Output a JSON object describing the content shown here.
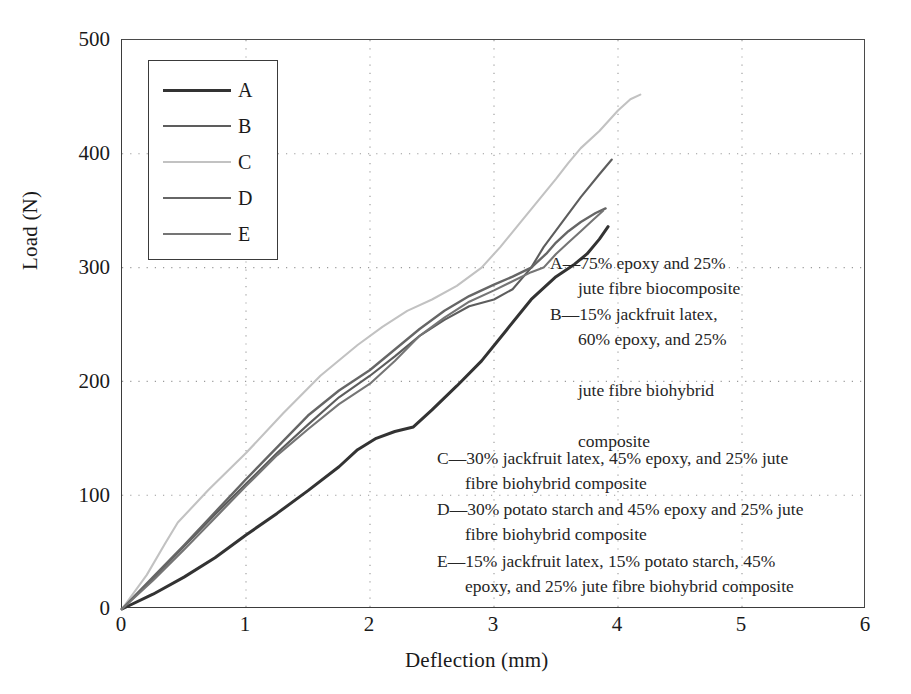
{
  "chart_data": {
    "type": "line",
    "title": "",
    "xlabel": "Deflection (mm)",
    "ylabel": "Load (N)",
    "xlim": [
      0,
      6
    ],
    "ylim": [
      0,
      500
    ],
    "xticks": [
      "0",
      "1",
      "2",
      "3",
      "4",
      "5",
      "6"
    ],
    "yticks": [
      "0",
      "100",
      "200",
      "300",
      "400",
      "500"
    ],
    "grid": "dotted",
    "legend_position": "upper-left-inside",
    "series": [
      {
        "name": "A",
        "color": "#333333",
        "width": 3.0,
        "points": [
          [
            0,
            0
          ],
          [
            0.25,
            13
          ],
          [
            0.5,
            28
          ],
          [
            0.75,
            45
          ],
          [
            1.0,
            65
          ],
          [
            1.25,
            84
          ],
          [
            1.5,
            104
          ],
          [
            1.75,
            125
          ],
          [
            1.9,
            140
          ],
          [
            2.05,
            150
          ],
          [
            2.2,
            156
          ],
          [
            2.35,
            160
          ],
          [
            2.5,
            175
          ],
          [
            2.7,
            196
          ],
          [
            2.9,
            218
          ],
          [
            3.1,
            245
          ],
          [
            3.3,
            272
          ],
          [
            3.5,
            292
          ],
          [
            3.65,
            303
          ],
          [
            3.75,
            312
          ],
          [
            3.85,
            325
          ],
          [
            3.92,
            336
          ]
        ]
      },
      {
        "name": "B",
        "color": "#5d5d5d",
        "width": 2.1,
        "points": [
          [
            0,
            0
          ],
          [
            0.25,
            27
          ],
          [
            0.5,
            55
          ],
          [
            0.75,
            83
          ],
          [
            1.0,
            110
          ],
          [
            1.25,
            137
          ],
          [
            1.5,
            162
          ],
          [
            1.75,
            186
          ],
          [
            2.0,
            205
          ],
          [
            2.2,
            222
          ],
          [
            2.4,
            240
          ],
          [
            2.6,
            254
          ],
          [
            2.8,
            266
          ],
          [
            3.0,
            272
          ],
          [
            3.15,
            281
          ],
          [
            3.3,
            300
          ],
          [
            3.4,
            318
          ],
          [
            3.55,
            340
          ],
          [
            3.7,
            362
          ],
          [
            3.85,
            382
          ],
          [
            3.95,
            395
          ]
        ]
      },
      {
        "name": "C",
        "color": "#c2c2c2",
        "width": 2.1,
        "points": [
          [
            0,
            0
          ],
          [
            0.2,
            30
          ],
          [
            0.35,
            58
          ],
          [
            0.45,
            76
          ],
          [
            0.7,
            105
          ],
          [
            1.0,
            137
          ],
          [
            1.3,
            172
          ],
          [
            1.6,
            205
          ],
          [
            1.9,
            232
          ],
          [
            2.1,
            248
          ],
          [
            2.3,
            262
          ],
          [
            2.5,
            272
          ],
          [
            2.7,
            284
          ],
          [
            2.9,
            300
          ],
          [
            3.05,
            318
          ],
          [
            3.2,
            338
          ],
          [
            3.35,
            358
          ],
          [
            3.5,
            378
          ],
          [
            3.6,
            392
          ],
          [
            3.7,
            405
          ],
          [
            3.85,
            420
          ],
          [
            4.0,
            438
          ],
          [
            4.1,
            448
          ],
          [
            4.18,
            452
          ]
        ]
      },
      {
        "name": "D",
        "color": "#666666",
        "width": 2.4,
        "points": [
          [
            0,
            0
          ],
          [
            0.25,
            28
          ],
          [
            0.5,
            56
          ],
          [
            0.75,
            85
          ],
          [
            1.0,
            114
          ],
          [
            1.25,
            142
          ],
          [
            1.5,
            170
          ],
          [
            1.75,
            192
          ],
          [
            2.0,
            210
          ],
          [
            2.2,
            228
          ],
          [
            2.4,
            246
          ],
          [
            2.6,
            262
          ],
          [
            2.8,
            275
          ],
          [
            3.0,
            285
          ],
          [
            3.15,
            292
          ],
          [
            3.3,
            300
          ],
          [
            3.42,
            312
          ],
          [
            3.5,
            322
          ],
          [
            3.6,
            332
          ],
          [
            3.7,
            340
          ],
          [
            3.82,
            348
          ],
          [
            3.9,
            352
          ]
        ]
      },
      {
        "name": "E",
        "color": "#757575",
        "width": 2.1,
        "points": [
          [
            0,
            0
          ],
          [
            0.25,
            25
          ],
          [
            0.5,
            52
          ],
          [
            0.75,
            80
          ],
          [
            1.0,
            108
          ],
          [
            1.25,
            135
          ],
          [
            1.5,
            158
          ],
          [
            1.75,
            180
          ],
          [
            2.0,
            198
          ],
          [
            2.2,
            218
          ],
          [
            2.4,
            240
          ],
          [
            2.6,
            256
          ],
          [
            2.8,
            270
          ],
          [
            3.0,
            280
          ],
          [
            3.15,
            288
          ],
          [
            3.3,
            296
          ],
          [
            3.4,
            300
          ],
          [
            3.5,
            312
          ],
          [
            3.6,
            322
          ],
          [
            3.7,
            332
          ],
          [
            3.8,
            342
          ],
          [
            3.88,
            350
          ]
        ]
      }
    ],
    "annotations": [
      "A—75% epoxy and 25% jute fibre biocomposite",
      "B—15% jackfruit latex, 60% epoxy, and 25% jute fibre biohybrid composite",
      "C—30% jackfruit latex, 45% epoxy, and 25% jute fibre biohybrid composite",
      "D—30% potato starch and 45% epoxy and 25% jute fibre biohybrid composite",
      "E—15% jackfruit latex, 15% potato starch, 45% epoxy, and 25% jute fibre biohybrid composite"
    ]
  },
  "legend": {
    "items": [
      {
        "label": "A"
      },
      {
        "label": "B"
      },
      {
        "label": "C"
      },
      {
        "label": "D"
      },
      {
        "label": "E"
      }
    ]
  },
  "descriptions": [
    {
      "id": "A",
      "line1": "A—75% epoxy and 25%",
      "line2": "jute fibre biocomposite"
    },
    {
      "id": "B",
      "line1": "B—15% jackfruit latex,",
      "line2": "60% epoxy, and 25%",
      "line3": "jute fibre biohybrid",
      "line4": "composite"
    },
    {
      "id": "C",
      "line1": "C—30% jackfruit latex, 45% epoxy, and 25% jute",
      "line2": "fibre biohybrid composite"
    },
    {
      "id": "D",
      "line1": "D—30% potato starch and 45% epoxy and 25% jute",
      "line2": "fibre biohybrid composite"
    },
    {
      "id": "E",
      "line1": "E—15% jackfruit latex, 15% potato starch, 45%",
      "line2": "epoxy, and 25% jute fibre biohybrid composite"
    }
  ]
}
